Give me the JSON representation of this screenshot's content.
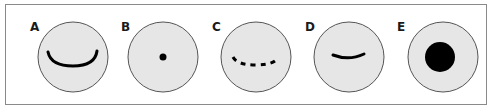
{
  "panels": [
    {
      "label": "A",
      "feature": "wide-solid-arc"
    },
    {
      "label": "B",
      "feature": "small-dot"
    },
    {
      "label": "C",
      "feature": "dashed-arc"
    },
    {
      "label": "D",
      "feature": "short-solid-arc"
    },
    {
      "label": "E",
      "feature": "large-filled-disc"
    }
  ],
  "colors": {
    "circle_fill": "#e6e6e6",
    "circle_stroke": "#555555",
    "mark": "#000000",
    "frame": "#8a8a8a"
  }
}
